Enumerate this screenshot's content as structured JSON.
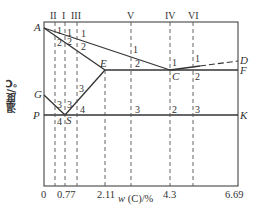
{
  "diagram": {
    "type": "Fe-C phase diagram (simplified)",
    "y_axis_label": "温度/℃",
    "x_axis_label_var": "w",
    "x_axis_label_rest": "(C)/%",
    "x_ticks": [
      "0",
      "0.77",
      "2.11",
      "4.3",
      "6.69"
    ],
    "points": {
      "A": "A",
      "D": "D",
      "E": "E",
      "C": "C",
      "F": "F",
      "G": "G",
      "S": "S",
      "P": "P",
      "K": "K"
    },
    "alloy_lines": [
      {
        "roman": "II",
        "region_numbers": [
          "1",
          "2",
          "3",
          "4"
        ]
      },
      {
        "roman": "I",
        "region_numbers": [
          "1",
          "2",
          "3"
        ]
      },
      {
        "roman": "III",
        "region_numbers": [
          "1",
          "2",
          "3",
          "4"
        ]
      },
      {
        "roman": "V",
        "region_numbers": [
          "1",
          "2",
          "3"
        ]
      },
      {
        "roman": "IV",
        "region_numbers": [
          "1",
          "2"
        ]
      },
      {
        "roman": "VI",
        "region_numbers": [
          "1",
          "2",
          "3"
        ]
      }
    ],
    "colors": {
      "line": "#333333",
      "dash": "#555555",
      "background": "#ffffff"
    }
  }
}
